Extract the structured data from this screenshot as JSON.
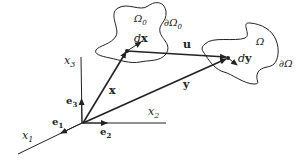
{
  "diagram": {
    "type": "continuum-mechanics-deformation",
    "labels": {
      "x1": "x",
      "x1_sub": "1",
      "x2": "x",
      "x2_sub": "2",
      "x3": "x",
      "x3_sub": "3",
      "e1": "e",
      "e1_sub": "1",
      "e2": "e",
      "e2_sub": "2",
      "e3": "e",
      "e3_sub": "3",
      "x_vec": "x",
      "y_vec": "y",
      "u_vec": "u",
      "dx_d": "d",
      "dx_x": "x",
      "dy_d": "d",
      "dy_y": "y",
      "omega0": "Ω",
      "omega0_sub": "0",
      "boundary0": "∂Ω",
      "boundary0_sub": "0",
      "omega": "Ω",
      "boundary": "∂Ω"
    },
    "colors": {
      "stroke": "#222222",
      "background": "#ffffff"
    }
  }
}
